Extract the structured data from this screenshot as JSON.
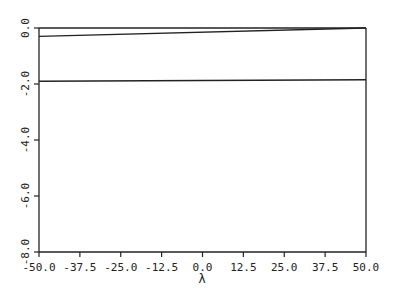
{
  "chart_data": {
    "type": "line",
    "title": "",
    "xlabel": "λ",
    "ylabel": "",
    "xlim": [
      -50.0,
      50.0
    ],
    "ylim": [
      -8.0,
      0.0
    ],
    "grid": false,
    "legend": null,
    "x_ticks": [
      "-50.0",
      "-37.5",
      "-25.0",
      "-12.5",
      "0.0",
      "12.5",
      "25.0",
      "37.5",
      "50.0"
    ],
    "y_ticks": [
      "0.0",
      "-2.0",
      "-4.0",
      "-6.0",
      "-8.0"
    ],
    "x": [
      -50.0,
      50.0
    ],
    "series": [
      {
        "name": "curve-1",
        "values": [
          0.0,
          0.0
        ]
      },
      {
        "name": "curve-2",
        "values": [
          -0.3,
          0.0
        ]
      },
      {
        "name": "curve-3",
        "values": [
          -1.9,
          -1.85
        ]
      }
    ],
    "line_color": "#222222"
  }
}
